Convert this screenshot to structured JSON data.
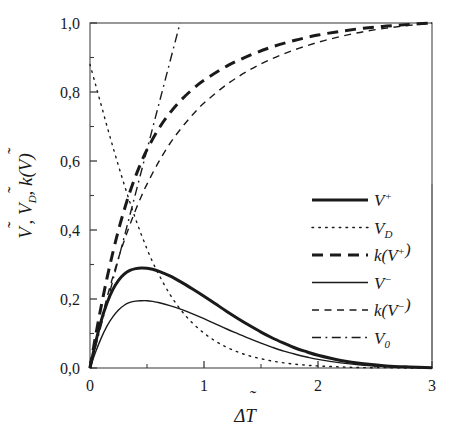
{
  "figure": {
    "background_color": "#ffffff",
    "ink_color": "#1a1a1a",
    "axis_color": "#4a4a4a"
  },
  "axes": {
    "x": {
      "title": "ΔT̃",
      "title_base": "ΔT",
      "min": 0,
      "max": 3,
      "major_ticks": [
        0,
        1,
        2,
        3
      ],
      "major_tick_labels": [
        "0",
        "1",
        "2",
        "3"
      ],
      "minor_tick_step": 0.5,
      "decimal_separator": "."
    },
    "y": {
      "title": "Ṽ, Ṽ_D, k(Ṽ)",
      "min": 0,
      "max": 1.0,
      "major_ticks": [
        0.0,
        0.2,
        0.4,
        0.6,
        0.8,
        1.0
      ],
      "major_tick_labels": [
        "0,0",
        "0,2",
        "0,4",
        "0,6",
        "0,8",
        "1,0"
      ],
      "minor_tick_step": 0.1,
      "decimal_separator": ","
    },
    "frame": "box",
    "grid": false
  },
  "legend": {
    "position": "center-right",
    "border": "right-edge-only",
    "entries": [
      {
        "label": "V+",
        "base": "V",
        "sup": "+",
        "sub": "",
        "style": "solid",
        "weight": "thick",
        "series_key": "V_plus"
      },
      {
        "label": "VD",
        "base": "V",
        "sup": "",
        "sub": "D",
        "style": "dotted",
        "weight": "thin",
        "series_key": "V_D"
      },
      {
        "label": "k(V+)",
        "base": "k(V",
        "sup": "+",
        "sub": "",
        "tail": ")",
        "style": "dashed",
        "weight": "thick",
        "series_key": "k_V_plus"
      },
      {
        "label": "V-",
        "base": "V",
        "sup": "−",
        "sub": "",
        "style": "solid",
        "weight": "thin",
        "series_key": "V_minus"
      },
      {
        "label": "k(V-)",
        "base": "k(V",
        "sup": "−",
        "sub": "",
        "tail": ")",
        "style": "dashed",
        "weight": "thin",
        "series_key": "k_V_minus"
      },
      {
        "label": "V0",
        "base": "V",
        "sup": "",
        "sub": "0",
        "style": "dashdot",
        "weight": "thin",
        "series_key": "V_0"
      }
    ]
  },
  "chart_data": {
    "type": "line",
    "title": "",
    "xlabel": "ΔT̃",
    "ylabel": "Ṽ, Ṽ_D, k(Ṽ)",
    "xlim": [
      0,
      3
    ],
    "ylim": [
      0,
      1.0
    ],
    "grid": false,
    "legend_position": "center-right",
    "series": [
      {
        "name": "V+",
        "key": "V_plus",
        "style": "solid",
        "linewidth": 3.0,
        "peak": {
          "x": 0.5,
          "y": 0.29
        },
        "x": [
          0.0,
          0.05,
          0.1,
          0.15,
          0.2,
          0.25,
          0.3,
          0.35,
          0.4,
          0.45,
          0.5,
          0.55,
          0.6,
          0.7,
          0.8,
          0.9,
          1.0,
          1.1,
          1.2,
          1.3,
          1.4,
          1.5,
          1.6,
          1.7,
          1.8,
          1.9,
          2.0,
          2.2,
          2.4,
          2.6,
          2.8,
          3.0
        ],
        "y": [
          0.0,
          0.075,
          0.139,
          0.189,
          0.227,
          0.254,
          0.272,
          0.283,
          0.288,
          0.29,
          0.289,
          0.286,
          0.281,
          0.267,
          0.249,
          0.229,
          0.208,
          0.186,
          0.164,
          0.143,
          0.123,
          0.104,
          0.087,
          0.072,
          0.058,
          0.047,
          0.037,
          0.022,
          0.012,
          0.006,
          0.003,
          0.001
        ]
      },
      {
        "name": "VD",
        "key": "V_D",
        "style": "dotted",
        "linewidth": 1.4,
        "note": "starts high near y=0.88 at x=0, descends to 0",
        "x": [
          0.0,
          0.05,
          0.1,
          0.15,
          0.2,
          0.25,
          0.3,
          0.35,
          0.4,
          0.45,
          0.5,
          0.55,
          0.6,
          0.7,
          0.8,
          0.9,
          1.0,
          1.1,
          1.2,
          1.3,
          1.4,
          1.5,
          1.6,
          1.7,
          1.8,
          1.9,
          2.0,
          2.2,
          2.4,
          2.6,
          2.8,
          3.0
        ],
        "y": [
          0.88,
          0.82,
          0.76,
          0.7,
          0.642,
          0.586,
          0.532,
          0.48,
          0.432,
          0.387,
          0.345,
          0.307,
          0.273,
          0.214,
          0.167,
          0.13,
          0.101,
          0.078,
          0.06,
          0.046,
          0.035,
          0.027,
          0.02,
          0.015,
          0.011,
          0.008,
          0.006,
          0.003,
          0.001,
          0.001,
          0.0,
          0.0
        ]
      },
      {
        "name": "k(V+)",
        "key": "k_V_plus",
        "style": "dashed",
        "linewidth": 3.0,
        "asymptote": 1.0,
        "x": [
          0.0,
          0.05,
          0.1,
          0.15,
          0.2,
          0.25,
          0.3,
          0.35,
          0.4,
          0.45,
          0.5,
          0.6,
          0.7,
          0.8,
          0.9,
          1.0,
          1.2,
          1.4,
          1.6,
          1.8,
          2.0,
          2.2,
          2.4,
          2.6,
          2.8,
          3.0
        ],
        "y": [
          0.0,
          0.095,
          0.182,
          0.262,
          0.334,
          0.4,
          0.458,
          0.51,
          0.556,
          0.597,
          0.633,
          0.692,
          0.739,
          0.777,
          0.808,
          0.834,
          0.875,
          0.906,
          0.931,
          0.95,
          0.965,
          0.976,
          0.985,
          0.991,
          0.996,
          1.0
        ]
      },
      {
        "name": "V-",
        "key": "V_minus",
        "style": "solid",
        "linewidth": 1.4,
        "peak": {
          "x": 0.52,
          "y": 0.195
        },
        "x": [
          0.0,
          0.05,
          0.1,
          0.15,
          0.2,
          0.25,
          0.3,
          0.35,
          0.4,
          0.45,
          0.5,
          0.55,
          0.6,
          0.7,
          0.8,
          0.9,
          1.0,
          1.1,
          1.2,
          1.3,
          1.4,
          1.5,
          1.6,
          1.7,
          1.8,
          1.9,
          2.0,
          2.2,
          2.4,
          2.6,
          2.8,
          3.0
        ],
        "y": [
          0.0,
          0.047,
          0.088,
          0.122,
          0.148,
          0.168,
          0.182,
          0.19,
          0.194,
          0.195,
          0.195,
          0.193,
          0.19,
          0.181,
          0.17,
          0.157,
          0.143,
          0.128,
          0.113,
          0.099,
          0.085,
          0.072,
          0.06,
          0.049,
          0.04,
          0.032,
          0.025,
          0.015,
          0.008,
          0.004,
          0.002,
          0.001
        ]
      },
      {
        "name": "k(V-)",
        "key": "k_V_minus",
        "style": "dashed",
        "linewidth": 1.4,
        "asymptote": 1.0,
        "x": [
          0.0,
          0.05,
          0.1,
          0.15,
          0.2,
          0.25,
          0.3,
          0.35,
          0.4,
          0.45,
          0.5,
          0.6,
          0.7,
          0.8,
          0.9,
          1.0,
          1.2,
          1.4,
          1.6,
          1.8,
          2.0,
          2.2,
          2.4,
          2.6,
          2.8,
          3.0
        ],
        "y": [
          0.0,
          0.073,
          0.141,
          0.205,
          0.264,
          0.319,
          0.369,
          0.415,
          0.458,
          0.497,
          0.533,
          0.596,
          0.65,
          0.695,
          0.734,
          0.768,
          0.822,
          0.864,
          0.897,
          0.923,
          0.944,
          0.961,
          0.975,
          0.985,
          0.993,
          1.0
        ]
      },
      {
        "name": "V0",
        "key": "V_0",
        "style": "dashdot",
        "linewidth": 1.4,
        "note": "straight line from origin, reaches y=1.0 at x=0.79",
        "x": [
          0.0,
          0.79
        ],
        "y": [
          0.0,
          1.0
        ]
      }
    ]
  }
}
